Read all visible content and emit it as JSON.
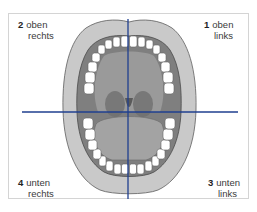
{
  "diagram": {
    "quadrants": [
      {
        "number": "1",
        "line1": "oben",
        "line2": "links",
        "position": "top-right"
      },
      {
        "number": "2",
        "line1": "oben",
        "line2": "rechts",
        "position": "top-left"
      },
      {
        "number": "3",
        "line1": "unten",
        "line2": "links",
        "position": "bottom-right"
      },
      {
        "number": "4",
        "line1": "unten",
        "line2": "rechts",
        "position": "bottom-left"
      }
    ],
    "colors": {
      "axis_line": "#1f3f8f",
      "frame_border": "#d4d4d4",
      "lip": "#c8c8c8",
      "lip_outline": "#6a6a6a",
      "mouth_interior": "#8c8c8c",
      "teeth": "#ffffff",
      "tongue": "#9e9e9e"
    }
  }
}
